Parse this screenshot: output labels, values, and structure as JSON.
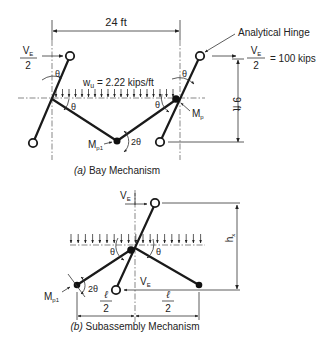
{
  "figure": {
    "bay_mechanism": {
      "span_label": "24 ft",
      "height_label": "9 ft",
      "load_label": "w",
      "load_sub": "u",
      "load_value": " = 2.22 kips/ft",
      "shear_left_num": "V",
      "shear_left_sub": "E",
      "shear_left_den": "2",
      "shear_right_num": "V",
      "shear_right_sub": "E",
      "shear_right_den": "2",
      "shear_right_value": "= 100 kips",
      "annotation": "Analytical Hinge",
      "theta": "θ",
      "two_theta": "2θ",
      "moment_plastic": "M",
      "moment_plastic_sub": "p",
      "moment_beam": "M",
      "moment_beam_sub": "p1",
      "caption_letter": "(a)",
      "caption": " Bay Mechanism"
    },
    "subassembly_mechanism": {
      "shear_top": "V",
      "shear_top_sub": "E",
      "shear_bottom": "V",
      "shear_bottom_sub": "E",
      "height_label": "h",
      "height_sub": "x",
      "half_span_num": "ℓ",
      "half_span_den": "2",
      "theta": "θ",
      "two_theta": "2θ",
      "moment_beam": "M",
      "moment_beam_sub": "p1",
      "caption_letter": "(b)",
      "caption": " Subassembly Mechanism"
    }
  }
}
